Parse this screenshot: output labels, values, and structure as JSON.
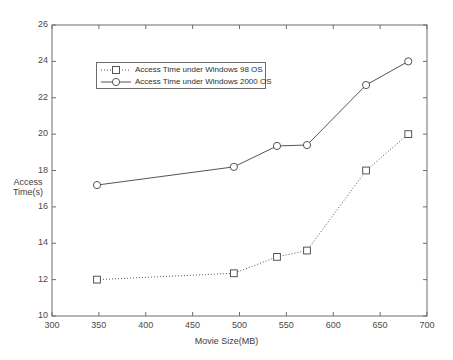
{
  "chart_data": {
    "type": "line",
    "title": "",
    "xlabel": "Movie Size(MB)",
    "ylabel": "Access Time(s)",
    "ylabel_line1": "Access",
    "ylabel_line2": "Time(s)",
    "xlim": [
      300,
      700
    ],
    "ylim": [
      10,
      26
    ],
    "xticks": [
      300,
      350,
      400,
      450,
      500,
      550,
      600,
      650,
      700
    ],
    "yticks": [
      10,
      12,
      14,
      16,
      18,
      20,
      22,
      24,
      26
    ],
    "grid": false,
    "legend_position": "upper-left-inside",
    "series": [
      {
        "name": "Access Time under Windows 98 OS",
        "marker": "square",
        "linestyle": "dotted",
        "color": "#555555",
        "x": [
          348,
          494,
          540,
          572,
          635,
          680
        ],
        "values": [
          12.0,
          12.35,
          13.25,
          13.6,
          18.0,
          20.0
        ]
      },
      {
        "name": "Access Time under Windows 2000 OS",
        "marker": "circle",
        "linestyle": "solid",
        "color": "#555555",
        "x": [
          348,
          494,
          540,
          572,
          635,
          680
        ],
        "values": [
          17.2,
          18.2,
          19.35,
          19.4,
          22.7,
          24.0
        ]
      }
    ]
  },
  "legend": {
    "entries": [
      {
        "label": "Access Time under Windows 98 OS",
        "marker": "square-marker",
        "linestyle": "dotted"
      },
      {
        "label": "Access Time under Windows 2000 OS",
        "marker": "circle-marker",
        "linestyle": "solid"
      }
    ]
  },
  "axes": {
    "x_tick_labels": [
      "300",
      "350",
      "400",
      "450",
      "500",
      "550",
      "600",
      "650",
      "700"
    ],
    "y_tick_labels": [
      "10",
      "12",
      "14",
      "16",
      "18",
      "20",
      "22",
      "24",
      "26"
    ]
  },
  "colors": {
    "axis": "#6d6d6d",
    "line": "#555555",
    "text": "#3a3a3a",
    "background": "#ffffff"
  }
}
